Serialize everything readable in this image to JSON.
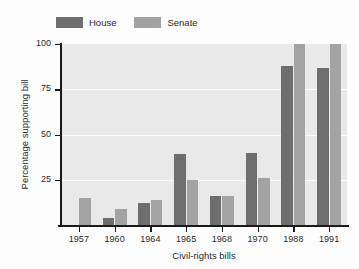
{
  "chart_data": {
    "type": "bar",
    "title": "",
    "xlabel": "Civil-rights bills",
    "ylabel": "Percentage supporting bill",
    "categories": [
      "1957",
      "1960",
      "1964",
      "1965",
      "1968",
      "1970",
      "1988",
      "1991"
    ],
    "series": [
      {
        "name": "House",
        "color": "#6e6e6e",
        "values": [
          0,
          4,
          12,
          39,
          16,
          40,
          88,
          87
        ]
      },
      {
        "name": "Senate",
        "color": "#a3a3a3",
        "values": [
          15,
          9,
          14,
          25,
          16,
          26,
          100,
          100
        ]
      }
    ],
    "ylim": [
      0,
      100
    ],
    "yticks": [
      "25",
      "50",
      "75",
      "100"
    ],
    "ytick_values": [
      25,
      50,
      75,
      100
    ],
    "grid": "horizontal-white",
    "legend_position": "above-left",
    "plot_background": "#e9e9e9",
    "axis_color": "#1a1a1a"
  }
}
